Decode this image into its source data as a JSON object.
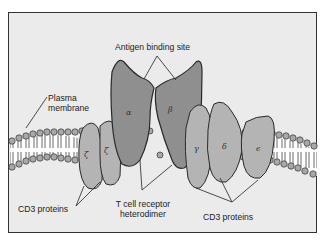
{
  "diagram": {
    "labels": {
      "antigen_binding_site": "Antigen binding site",
      "plasma_membrane_line1": "Plasma",
      "plasma_membrane_line2": "membrane",
      "cd3_left": "CD3 proteins",
      "tcr_line1": "T cell receptor",
      "tcr_line2": "heterodimer",
      "cd3_right": "CD3 proteins"
    },
    "chains": {
      "zeta1": "ζ",
      "zeta2": "ζ",
      "alpha": "α",
      "beta": "β",
      "gamma": "γ",
      "delta": "δ",
      "epsilon": "ϵ"
    },
    "colors": {
      "background": "#ebebeb",
      "frame": "#333333",
      "tcr_chain": "#8f8f8f",
      "cd3_chain": "#b4b4b4",
      "lipid_head": "#a8a8a8",
      "outline": "#2a2a2a"
    }
  }
}
